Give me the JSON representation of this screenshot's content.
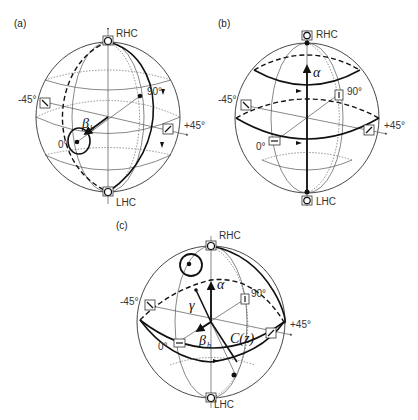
{
  "panels": [
    {
      "id": "a",
      "label": "(a)",
      "poles": {
        "top": "RHC",
        "bottom": "LHC"
      },
      "equator_labels": {
        "left": "-45°",
        "right": "+45°",
        "front": "0°",
        "back": "90°"
      },
      "annotations": {
        "beta": "β",
        "beta_sub": "b"
      }
    },
    {
      "id": "b",
      "label": "(b)",
      "poles": {
        "top": "RHC",
        "bottom": "LHC"
      },
      "equator_labels": {
        "left": "-45°",
        "right": "+45°",
        "front": "0°",
        "back": "90°"
      },
      "annotations": {
        "alpha": "α"
      }
    },
    {
      "id": "c",
      "label": "(c)",
      "poles": {
        "top": "RHC",
        "bottom": "LHC"
      },
      "equator_labels": {
        "left": "-45°",
        "right": "+45°",
        "front": "0°",
        "back": "90°"
      },
      "annotations": {
        "alpha": "α",
        "gamma": "γ",
        "beta": "β",
        "beta_sub": "b",
        "curve": "C(z)"
      }
    }
  ],
  "colors": {
    "line": "#111111",
    "grid": "#555555",
    "background": "#ffffff"
  }
}
